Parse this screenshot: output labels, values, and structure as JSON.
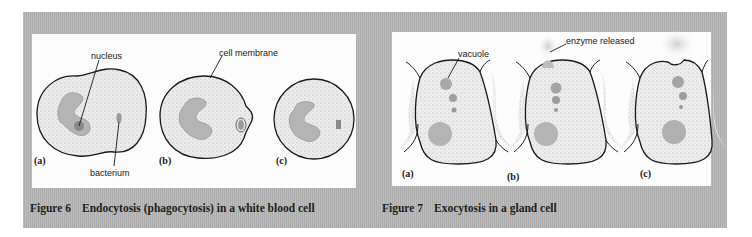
{
  "figure6": {
    "caption_number": "Figure 6",
    "caption_title": "Endocytosis (phagocytosis) in a white blood cell",
    "labels": {
      "nucleus": "nucleus",
      "cell_membrane": "cell membrane",
      "bacterium": "bacterium"
    },
    "stages": [
      "(a)",
      "(b)",
      "(c)"
    ]
  },
  "figure7": {
    "caption_number": "Figure 7",
    "caption_title": "Exocytosis in a gland cell",
    "labels": {
      "vacuole": "vacuole",
      "enzyme_released": "enzyme released"
    },
    "stages": [
      "(a)",
      "(b)",
      "(c)"
    ]
  },
  "colors": {
    "panel_gray": "#b4b4b4",
    "inset_white": "#fcfcfc",
    "cytoplasm": "#e8e8e8",
    "nucleus_fill": "#b0b0b0",
    "outline": "#1a1a1a",
    "enzyme": "#d2d2d2"
  }
}
